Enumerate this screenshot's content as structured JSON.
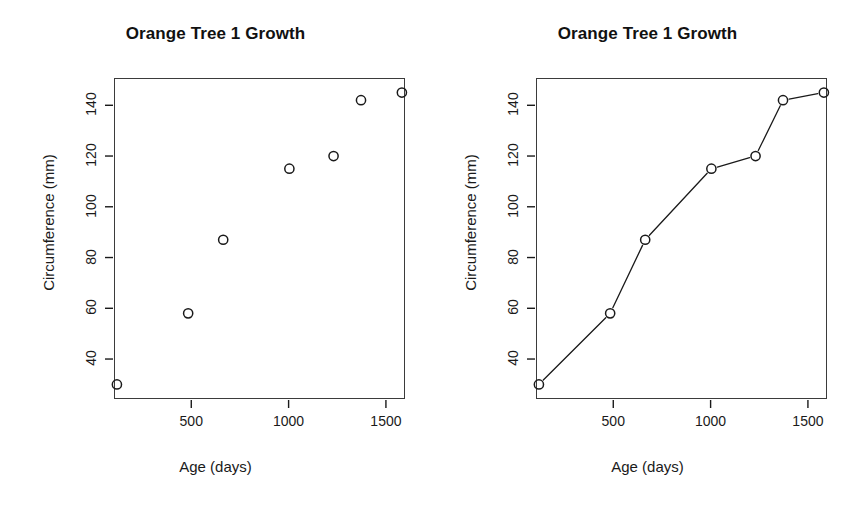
{
  "page": {
    "background_color": "#ffffff",
    "foreground_color": "#1a1a1a",
    "width": 863,
    "height": 518
  },
  "panels": [
    {
      "id": "scatter",
      "title": "Orange Tree 1 Growth",
      "xlabel": "Age (days)",
      "ylabel": "Circumference (mm)"
    },
    {
      "id": "line-points",
      "title": "Orange Tree 1 Growth",
      "xlabel": "Age (days)",
      "ylabel": "Circumference (mm)"
    }
  ],
  "axes": {
    "x_ticks": [
      500,
      1000,
      1500
    ],
    "x_tick_labels": [
      "500",
      "1000",
      "1500"
    ],
    "y_ticks": [
      40,
      60,
      80,
      100,
      120,
      140
    ],
    "y_tick_labels": [
      "40",
      "60",
      "80",
      "100",
      "120",
      "140"
    ],
    "xlim": [
      103,
      1598
    ],
    "ylim": [
      24.25,
      150.75
    ]
  },
  "chart_data": [
    {
      "type": "scatter",
      "title": "Orange Tree 1 Growth",
      "xlabel": "Age (days)",
      "ylabel": "Circumference (mm)",
      "x": [
        118,
        484,
        664,
        1004,
        1231,
        1372,
        1582
      ],
      "values": [
        30,
        58,
        87,
        115,
        120,
        142,
        145
      ],
      "xlim": [
        103,
        1598
      ],
      "ylim": [
        24.25,
        150.75
      ],
      "xticks": [
        500,
        1000,
        1500
      ],
      "yticks": [
        40,
        60,
        80,
        100,
        120,
        140
      ],
      "grid": false,
      "legend": false,
      "marker": "open-circle",
      "marker_color": "#1a1a1a",
      "line": false
    },
    {
      "type": "line",
      "title": "Orange Tree 1 Growth",
      "xlabel": "Age (days)",
      "ylabel": "Circumference (mm)",
      "x": [
        118,
        484,
        664,
        1004,
        1231,
        1372,
        1582
      ],
      "values": [
        30,
        58,
        87,
        115,
        120,
        142,
        145
      ],
      "xlim": [
        103,
        1598
      ],
      "ylim": [
        24.25,
        150.75
      ],
      "xticks": [
        500,
        1000,
        1500
      ],
      "yticks": [
        40,
        60,
        80,
        100,
        120,
        140
      ],
      "grid": false,
      "legend": false,
      "marker": "open-circle",
      "marker_color": "#1a1a1a",
      "line": true,
      "line_color": "#1a1a1a"
    }
  ]
}
